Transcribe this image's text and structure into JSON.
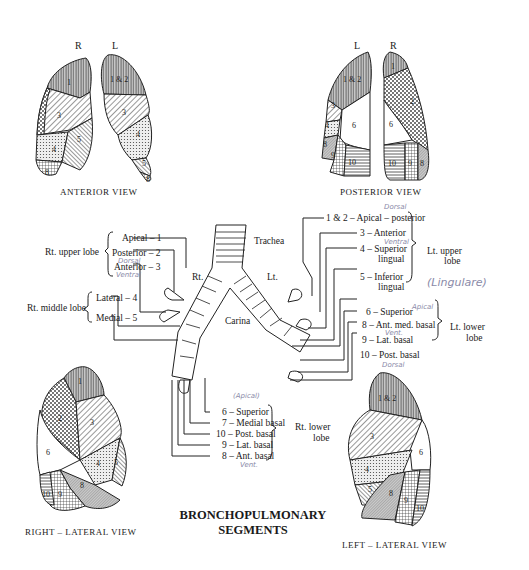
{
  "title": {
    "line1": "BRONCHOPULMONARY",
    "line2": "SEGMENTS"
  },
  "views": {
    "anterior": {
      "caption": "ANTERIOR VIEW",
      "side_left": "R",
      "side_right": "L",
      "right_lung_segments": [
        "1",
        "2",
        "3",
        "4",
        "5",
        "8"
      ],
      "left_lung_segments": [
        "1 & 2",
        "3",
        "4",
        "5",
        "8"
      ]
    },
    "posterior": {
      "caption": "POSTERIOR VIEW",
      "side_left": "L",
      "side_right": "R",
      "left_lung_segments": [
        "1 & 2",
        "3",
        "4",
        "6",
        "8",
        "9",
        "10"
      ],
      "right_lung_segments": [
        "1",
        "2",
        "6",
        "10",
        "9",
        "8"
      ]
    },
    "right_lateral": {
      "caption": "RIGHT – LATERAL VIEW",
      "segments": [
        "1",
        "2",
        "3",
        "6",
        "4",
        "5",
        "8",
        "9",
        "10"
      ]
    },
    "left_lateral": {
      "caption": "LEFT – LATERAL VIEW",
      "segments": [
        "1 & 2",
        "3",
        "6",
        "4",
        "5",
        "8",
        "9",
        "10"
      ]
    }
  },
  "airway": {
    "trachea": "Trachea",
    "carina": "Carina",
    "right_main": "Rt.",
    "left_main": "Lt."
  },
  "right_side": {
    "upper_lobe": {
      "label": "Rt. upper lobe",
      "segments": [
        "Apical – 1",
        "Posterior – 2",
        "Anterior – 3"
      ]
    },
    "middle_lobe": {
      "label": "Rt. middle lobe",
      "segments": [
        "Lateral – 4",
        "Medial – 5"
      ]
    },
    "lower_lobe": {
      "label_line1": "Rt. lower",
      "label_line2": "lobe",
      "segments": [
        "6 – Superior",
        "7 – Medial basal",
        "10 – Post. basal",
        "9 – Lat. basal",
        "8 – Ant. basal"
      ]
    }
  },
  "left_side": {
    "upper_lobe": {
      "label_line1": "Lt. upper",
      "label_line2": "lobe",
      "segments": [
        "1 & 2 – Apical – posterior",
        "3 – Anterior",
        "4 – Superior",
        "lingual",
        "5 – Inferior",
        "lingual"
      ]
    },
    "lower_lobe": {
      "label_line1": "Lt. lower",
      "label_line2": "lobe",
      "segments": [
        "6 – Superior",
        "8 – Ant. med. basal",
        "9 – Lat. basal",
        "10 – Post. basal"
      ]
    }
  },
  "handwritten_notes": {
    "dorsal_r": "Dorsal",
    "ventral_r": "Ventral",
    "apical_r": "(Apical)",
    "ventral_r2": "Vent.",
    "dorsal_r2": "Dorsal",
    "dorsal_l": "Dorsal",
    "ventral_l": "Ventral",
    "lingulare": "(Lingulare)",
    "apical_l": "Apical",
    "vent_l": "Vent.",
    "dorsal_l2": "Dorsal"
  }
}
